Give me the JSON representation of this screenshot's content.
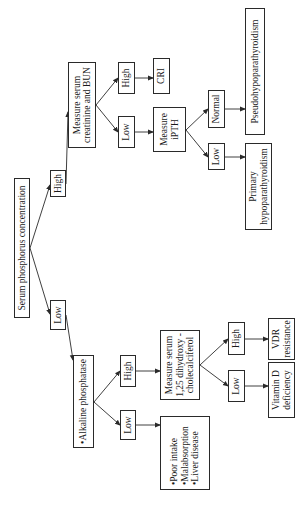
{
  "diagram": {
    "title": "Serum phosphorus concentration",
    "orientation": "rotated-90-ccw",
    "nodes": {
      "root": "Serum phosphorus concentration",
      "high_1": "High",
      "low_1": "Low",
      "creatinine": "Measure serum\ncreatinine and BUN",
      "high_2": "High",
      "low_2": "Low",
      "cri": "CRI",
      "ipth": "Measure\niPTH",
      "normal_3": "Normal",
      "low_3": "Low",
      "pseudo": "Pseudohypoparathyroidism",
      "primary": "Primary\nhypoparathyroidism",
      "alk": "•Alkaline phosphatase",
      "high_4": "High",
      "low_4": "Low",
      "vitd_measure": "Measure serum\n1,25 dihydroxy -\ncholecalciferol",
      "causes": "•Poor intake\n•Malabsorption\n•Liver disease",
      "high_5": "High",
      "low_5": "Low",
      "vdr": "VDR\nresistance",
      "vitd_def": "Vitamin D\ndeficiency"
    },
    "edges": [
      [
        "root",
        "high_1"
      ],
      [
        "root",
        "low_1"
      ],
      [
        "high_1",
        "creatinine"
      ],
      [
        "creatinine",
        "high_2"
      ],
      [
        "creatinine",
        "low_2"
      ],
      [
        "high_2",
        "cri"
      ],
      [
        "low_2",
        "ipth"
      ],
      [
        "ipth",
        "normal_3"
      ],
      [
        "ipth",
        "low_3"
      ],
      [
        "normal_3",
        "pseudo"
      ],
      [
        "low_3",
        "primary"
      ],
      [
        "low_1",
        "alk"
      ],
      [
        "alk",
        "high_4"
      ],
      [
        "alk",
        "low_4"
      ],
      [
        "high_4",
        "vitd_measure"
      ],
      [
        "low_4",
        "causes"
      ],
      [
        "vitd_measure",
        "high_5"
      ],
      [
        "vitd_measure",
        "low_5"
      ],
      [
        "high_5",
        "vdr"
      ],
      [
        "low_5",
        "vitd_def"
      ]
    ]
  }
}
